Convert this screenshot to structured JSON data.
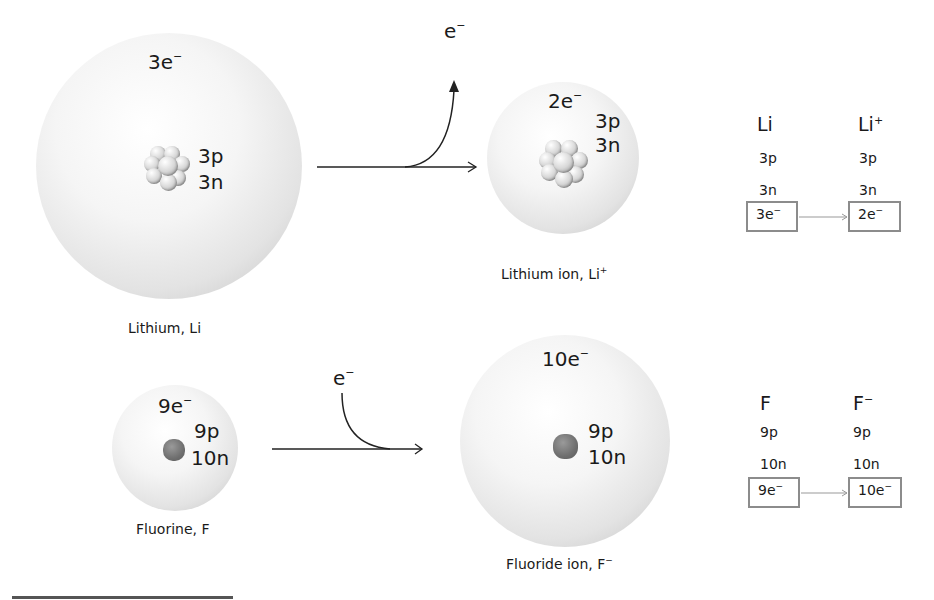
{
  "lithium": {
    "atom": {
      "electrons": "3e",
      "protons": "3p",
      "neutrons": "3n",
      "caption": "Lithium, Li",
      "charge_sup": "−"
    },
    "process_label": "e",
    "process_label_sup": "−",
    "ion": {
      "electrons": "2e",
      "protons": "3p",
      "neutrons": "3n",
      "caption": "Lithium ion, Li",
      "caption_sup": "+"
    },
    "table": {
      "col1_head": "Li",
      "col2_head": "Li",
      "col2_sup": "+",
      "col1_p": "3p",
      "col2_p": "3p",
      "col1_n": "3n",
      "col2_n": "3n",
      "col1_e": "3e",
      "col2_e": "2e"
    }
  },
  "fluorine": {
    "atom": {
      "electrons": "9e",
      "protons": "9p",
      "neutrons": "10n",
      "caption": "Fluorine, F"
    },
    "process_label": "e",
    "process_label_sup": "−",
    "ion": {
      "electrons": "10e",
      "protons": "9p",
      "neutrons": "10n",
      "caption": "Fluoride ion, F",
      "caption_sup": "−"
    },
    "table": {
      "col1_head": "F",
      "col2_head": "F",
      "col2_sup": "−",
      "col1_p": "9p",
      "col2_p": "9p",
      "col1_n": "10n",
      "col2_n": "10n",
      "col1_e": "9e",
      "col2_e": "10e"
    }
  },
  "minus": "−",
  "colors": {
    "box_border": "#8c8c8c",
    "arrow": "#222222",
    "table_arrow": "#999999"
  }
}
